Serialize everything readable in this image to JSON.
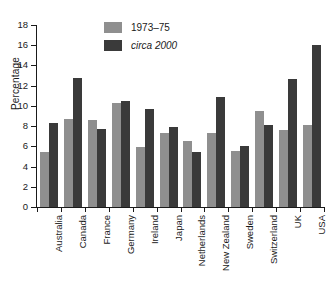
{
  "chart_data": {
    "type": "bar",
    "title": "",
    "xlabel": "",
    "ylabel": "Percentage",
    "ylim": [
      0,
      18
    ],
    "ytick_values": [
      0,
      2,
      4,
      6,
      8,
      10,
      12,
      14,
      16,
      18
    ],
    "ytick_labels": [
      "0",
      "2",
      "4",
      "6",
      "8",
      "10",
      "12",
      "14",
      "16",
      "18"
    ],
    "grid": false,
    "legend_position": "top-center",
    "categories": [
      "Australia",
      "Canada",
      "France",
      "Germany",
      "Ireland",
      "Japan",
      "Netherlands",
      "New Zealand",
      "Sweden",
      "Switzerland",
      "UK",
      "USA"
    ],
    "series": [
      {
        "name": "1973–75",
        "color": "#8f8f8f",
        "style": "normal",
        "values": [
          5.4,
          8.7,
          8.6,
          10.25,
          5.9,
          7.3,
          6.5,
          7.3,
          5.5,
          9.5,
          7.6,
          8.1
        ]
      },
      {
        "name": "circa 2000",
        "color": "#3a3a3a",
        "style": "italic",
        "values": [
          8.3,
          12.8,
          7.7,
          10.45,
          9.7,
          7.9,
          5.45,
          10.9,
          6.05,
          8.1,
          12.7,
          16.0
        ]
      }
    ]
  }
}
